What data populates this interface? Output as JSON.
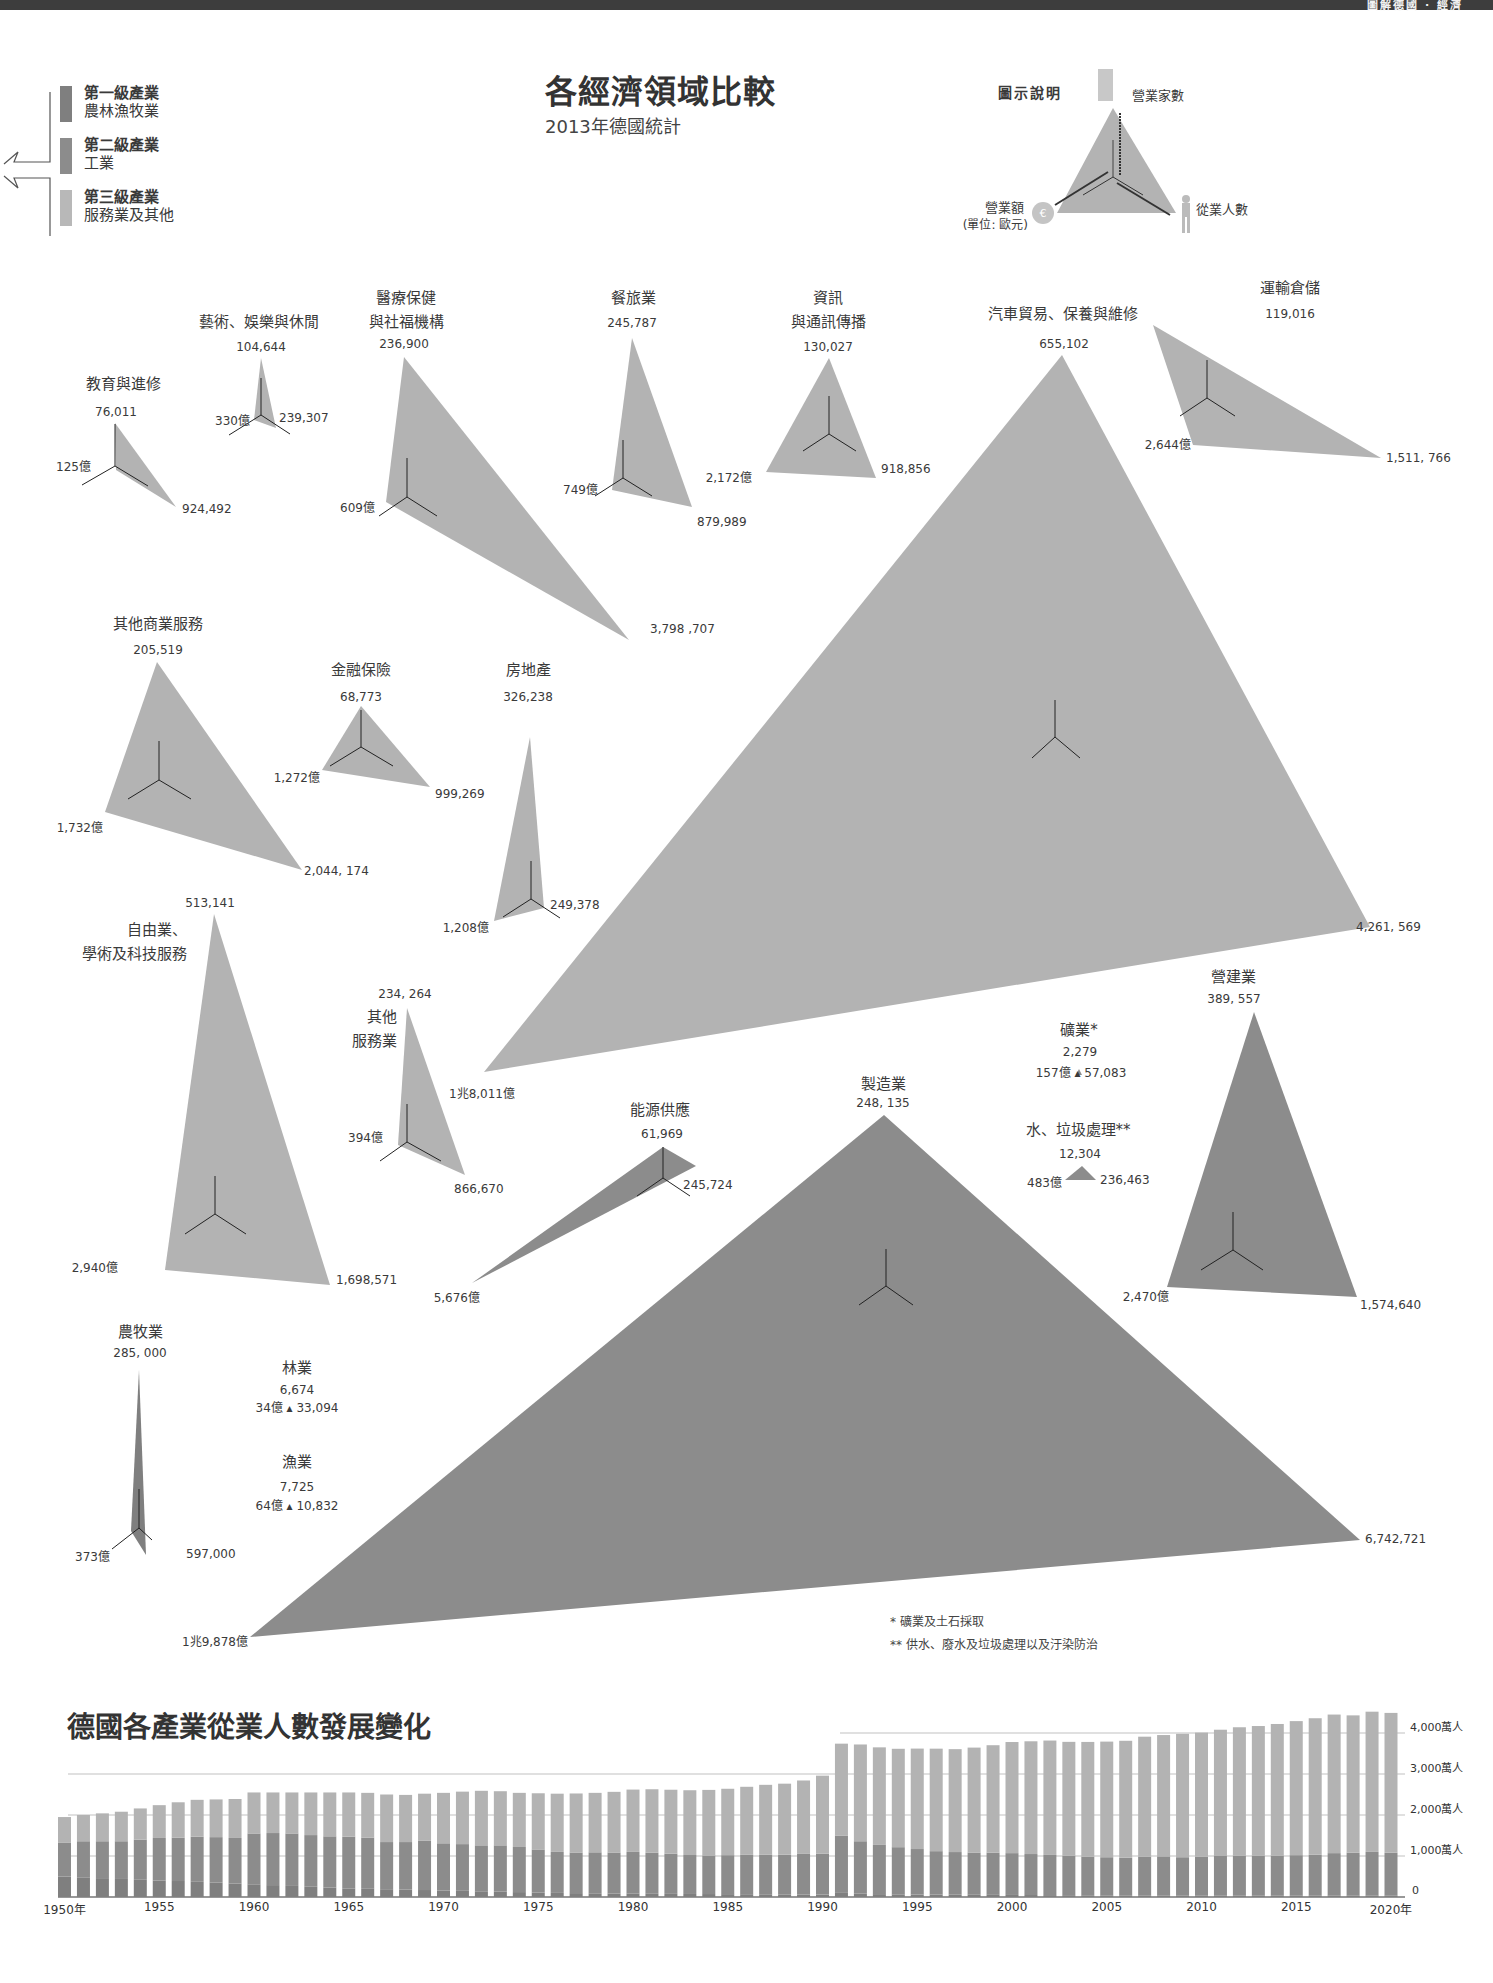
{
  "header": {
    "running_title": "圖解德國 · 經濟"
  },
  "legend": {
    "items": [
      {
        "title": "第一級產業",
        "sub": "農林漁牧業",
        "color": "#808080"
      },
      {
        "title": "第二級產業",
        "sub": "工業",
        "color": "#8e8e8e"
      },
      {
        "title": "第三級產業",
        "sub": "服務業及其他",
        "color": "#b4b4b4"
      }
    ]
  },
  "title": {
    "main": "各經濟領域比較",
    "sub": "2013年德國統計"
  },
  "key": {
    "title": "圖示說明",
    "top": "營業家數",
    "right": "從業人數",
    "left": "營業額",
    "left_unit": "(單位: 歐元)"
  },
  "footnotes": [
    "* 礦業及土石採取",
    "** 供水、廢水及垃圾處理以及汙染防治"
  ],
  "colors": {
    "primary": "#7f7f7f",
    "secondary": "#8c8c8c",
    "tertiary": "#b3b3b3",
    "line": "#333333"
  },
  "chart_data": [
    {
      "type": "table",
      "title": "各經濟領域比較",
      "subtitle": "2013年德國統計",
      "columns": [
        "sector",
        "sector_level",
        "enterprises",
        "employees",
        "turnover_eur"
      ],
      "rows": [
        {
          "sector": "教育與進修",
          "level": "tertiary",
          "enterprises": "76,011",
          "employees": "924,492",
          "turnover": "125億"
        },
        {
          "sector": "藝術、娛樂與休閒",
          "level": "tertiary",
          "enterprises": "104,644",
          "employees": "239,307",
          "turnover": "330億"
        },
        {
          "sector": "醫療保健與社福機構",
          "level": "tertiary",
          "enterprises": "236,900",
          "employees": "3,798,707",
          "turnover": "609億"
        },
        {
          "sector": "餐旅業",
          "level": "tertiary",
          "enterprises": "245,787",
          "employees": "879,989",
          "turnover": "749億"
        },
        {
          "sector": "資訊與通訊傳播",
          "level": "tertiary",
          "enterprises": "130,027",
          "employees": "918,856",
          "turnover": "2,172億"
        },
        {
          "sector": "汽車貿易、保養與維修",
          "level": "tertiary",
          "enterprises": "655,102",
          "employees": "4,261,569",
          "turnover": "1兆8,011億"
        },
        {
          "sector": "運輸倉儲",
          "level": "tertiary",
          "enterprises": "119,016",
          "employees": "1,511,766",
          "turnover": "2,644億"
        },
        {
          "sector": "其他商業服務",
          "level": "tertiary",
          "enterprises": "205,519",
          "employees": "2,044,174",
          "turnover": "1,732億"
        },
        {
          "sector": "金融保險",
          "level": "tertiary",
          "enterprises": "68,773",
          "employees": "999,269",
          "turnover": "1,272億"
        },
        {
          "sector": "房地產",
          "level": "tertiary",
          "enterprises": "326,238",
          "employees": "249,378",
          "turnover": "1,208億"
        },
        {
          "sector": "自由業、學術及科技服務",
          "level": "tertiary",
          "enterprises": "513,141",
          "employees": "1,698,571",
          "turnover": "2,940億"
        },
        {
          "sector": "其他服務業",
          "level": "tertiary",
          "enterprises": "234,264",
          "employees": "866,670",
          "turnover": "394億"
        },
        {
          "sector": "能源供應",
          "level": "secondary",
          "enterprises": "61,969",
          "employees": "245,724",
          "turnover": "5,676億"
        },
        {
          "sector": "製造業",
          "level": "secondary",
          "enterprises": "248,135",
          "employees": "6,742,721",
          "turnover": "1兆9,878億"
        },
        {
          "sector": "礦業*",
          "level": "secondary",
          "enterprises": "2,279",
          "employees": "57,083",
          "turnover": "157億"
        },
        {
          "sector": "水、垃圾處理**",
          "level": "secondary",
          "enterprises": "12,304",
          "employees": "236,463",
          "turnover": "483億"
        },
        {
          "sector": "營建業",
          "level": "secondary",
          "enterprises": "389,557",
          "employees": "1,574,640",
          "turnover": "2,470億"
        },
        {
          "sector": "農牧業",
          "level": "primary",
          "enterprises": "285,000",
          "employees": "597,000",
          "turnover": "373億"
        },
        {
          "sector": "林業",
          "level": "primary",
          "enterprises": "6,674",
          "employees": "33,094",
          "turnover": "34億"
        },
        {
          "sector": "漁業",
          "level": "primary",
          "enterprises": "7,725",
          "employees": "10,832",
          "turnover": "64億"
        }
      ]
    },
    {
      "type": "bar",
      "stacked": true,
      "title": "德國各產業從業人數發展變化",
      "xlabel": "年",
      "ylabel": "萬人",
      "ylim": [
        0,
        4500
      ],
      "yticks": [
        "0",
        "1,000萬人",
        "2,000萬人",
        "3,000萬人",
        "4,000萬人"
      ],
      "xticks": [
        "1950年",
        "1955",
        "1960",
        "1965",
        "1970",
        "1975",
        "1980",
        "1985",
        "1990",
        "1995",
        "2000",
        "2005",
        "2010",
        "2015",
        "2020年"
      ],
      "grid": true,
      "categories": [
        1950,
        1951,
        1952,
        1953,
        1954,
        1955,
        1956,
        1957,
        1958,
        1959,
        1960,
        1961,
        1962,
        1963,
        1964,
        1965,
        1966,
        1967,
        1968,
        1969,
        1970,
        1971,
        1972,
        1973,
        1974,
        1975,
        1976,
        1977,
        1978,
        1979,
        1980,
        1981,
        1982,
        1983,
        1984,
        1985,
        1986,
        1987,
        1988,
        1989,
        1990,
        1991,
        1992,
        1993,
        1994,
        1995,
        1996,
        1997,
        1998,
        1999,
        2000,
        2001,
        2002,
        2003,
        2004,
        2005,
        2006,
        2007,
        2008,
        2009,
        2010,
        2011,
        2012,
        2013,
        2014,
        2015,
        2016,
        2017,
        2018,
        2019,
        2020
      ],
      "series": [
        {
          "name": "第一級產業",
          "values": [
            500,
            480,
            460,
            440,
            420,
            400,
            390,
            370,
            350,
            330,
            310,
            290,
            270,
            250,
            230,
            210,
            200,
            190,
            180,
            170,
            160,
            150,
            140,
            130,
            120,
            110,
            100,
            95,
            90,
            85,
            80,
            78,
            76,
            74,
            72,
            70,
            68,
            66,
            64,
            62,
            60,
            100,
            80,
            70,
            65,
            60,
            58,
            56,
            54,
            52,
            50,
            48,
            46,
            44,
            42,
            40,
            40,
            40,
            40,
            40,
            40,
            40,
            40,
            40,
            40,
            40,
            40,
            40,
            40,
            40,
            40
          ]
        },
        {
          "name": "第二級產業",
          "values": [
            830,
            880,
            900,
            920,
            980,
            1040,
            1060,
            1100,
            1110,
            1110,
            1240,
            1270,
            1280,
            1260,
            1250,
            1260,
            1250,
            1150,
            1160,
            1200,
            1150,
            1140,
            1120,
            1130,
            1100,
            1050,
            1000,
            990,
            1000,
            1000,
            1020,
            1000,
            980,
            950,
            940,
            950,
            960,
            970,
            970,
            990,
            1000,
            1400,
            1280,
            1200,
            1150,
            1110,
            1060,
            1040,
            1030,
            1030,
            1020,
            1000,
            980,
            960,
            940,
            930,
            920,
            940,
            950,
            930,
            940,
            960,
            970,
            970,
            970,
            980,
            990,
            1030,
            1040,
            1060,
            1040
          ]
        },
        {
          "name": "第三級產業",
          "values": [
            620,
            640,
            680,
            720,
            760,
            800,
            860,
            900,
            920,
            950,
            1000,
            990,
            1000,
            1040,
            1070,
            1080,
            1090,
            1160,
            1150,
            1150,
            1230,
            1280,
            1330,
            1320,
            1320,
            1370,
            1420,
            1440,
            1450,
            1480,
            1520,
            1550,
            1560,
            1580,
            1600,
            1620,
            1660,
            1700,
            1730,
            1790,
            1900,
            2240,
            2360,
            2380,
            2400,
            2450,
            2500,
            2510,
            2560,
            2620,
            2710,
            2750,
            2790,
            2780,
            2800,
            2820,
            2850,
            2930,
            2960,
            3010,
            3030,
            3080,
            3130,
            3160,
            3210,
            3270,
            3330,
            3380,
            3350,
            3420,
            3410
          ]
        }
      ]
    }
  ],
  "sectors": {
    "edu": {
      "name": "教育與進修",
      "a": "76,011",
      "b": "924,492",
      "c": "125億"
    },
    "art": {
      "name": "藝術、娛樂與休閒",
      "a": "104,644",
      "b": "239,307",
      "c": "330億"
    },
    "med": {
      "name1": "醫療保健",
      "name2": "與社福機構",
      "a": "236,900",
      "b": "3,798 ,707",
      "c": "609億"
    },
    "food": {
      "name": "餐旅業",
      "a": "245,787",
      "b": "879,989",
      "c": "749億"
    },
    "info": {
      "name1": "資訊",
      "name2": "與通訊傳播",
      "a": "130,027",
      "b": "918,856",
      "c": "2,172億"
    },
    "car": {
      "name": "汽車貿易、保養與維修",
      "a": "655,102",
      "b": "4,261, 569",
      "c": "1兆8,011億"
    },
    "trans": {
      "name": "運輸倉儲",
      "a": "119,016",
      "b": "1,511, 766",
      "c": "2,644億"
    },
    "biz": {
      "name": "其他商業服務",
      "a": "205,519",
      "b": "2,044, 174",
      "c": "1,732億"
    },
    "fin": {
      "name": "金融保險",
      "a": "68,773",
      "b": "999,269",
      "c": "1,272億"
    },
    "real": {
      "name": "房地產",
      "a": "326,238",
      "b": "249,378",
      "c": "1,208億"
    },
    "prof": {
      "name1": "自由業、",
      "name2": "學術及科技服務",
      "a": "513,141",
      "b": "1,698,571",
      "c": "2,940億"
    },
    "oth": {
      "name1": "其他",
      "name2": "服務業",
      "a": "234, 264",
      "b": "866,670",
      "c": "394億"
    },
    "energy": {
      "name": "能源供應",
      "a": "61,969",
      "b": "245,724",
      "c": "5,676億"
    },
    "manu": {
      "name": "製造業",
      "a": "248, 135",
      "b": "6,742,721",
      "c": "1兆9,878億"
    },
    "mine": {
      "name": "礦業*",
      "a": "2,279",
      "line": "157億 ▴ 57,083"
    },
    "water": {
      "name": "水、垃圾處理**",
      "a": "12,304",
      "c": "483億",
      "b": "236,463"
    },
    "cons": {
      "name": "營建業",
      "a": "389, 557",
      "b": "1,574,640",
      "c": "2,470億"
    },
    "agri": {
      "name": "農牧業",
      "a": "285, 000",
      "b": "597,000",
      "c": "373億"
    },
    "forest": {
      "name": "林業",
      "a": "6,674",
      "line": "34億 ▴ 33,094"
    },
    "fish": {
      "name": "漁業",
      "a": "7,725",
      "line": "64億 ▴ 10,832"
    }
  }
}
